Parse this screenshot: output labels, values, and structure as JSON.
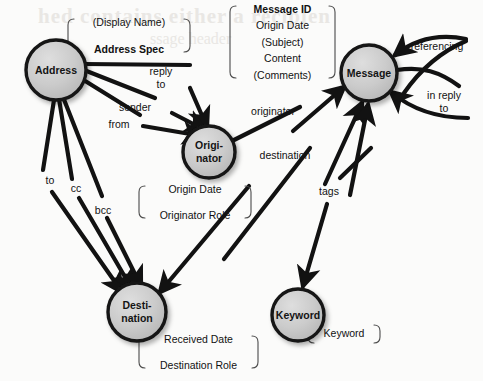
{
  "diagram": {
    "type": "entity-relationship",
    "background_color": "#fbfbfa",
    "node_fill_color": "#c9c9c9",
    "node_stroke_color": "#141414",
    "edge_color": "#121212",
    "nodes": [
      {
        "id": "address",
        "label_line1": "Address",
        "label_line2": "",
        "cx": 56,
        "cy": 70,
        "r": 30
      },
      {
        "id": "originator",
        "label_line1": "Origi-",
        "label_line2": "nator",
        "cx": 209,
        "cy": 152,
        "r": 26
      },
      {
        "id": "message",
        "label_line1": "Message",
        "label_line2": "",
        "cx": 369,
        "cy": 73,
        "r": 28
      },
      {
        "id": "destination",
        "label_line1": "Desti-",
        "label_line2": "nation",
        "cx": 137,
        "cy": 312,
        "r": 29
      },
      {
        "id": "keyword",
        "label_line1": "Keyword",
        "label_line2": "",
        "cx": 298,
        "cy": 315,
        "r": 26
      }
    ],
    "edge_labels": [
      {
        "id": "reply-to",
        "lines": [
          "reply",
          "to"
        ],
        "x": 161,
        "y": 79
      },
      {
        "id": "sender",
        "lines": [
          "sender"
        ],
        "x": 135,
        "y": 108
      },
      {
        "id": "from",
        "lines": [
          "from"
        ],
        "x": 119,
        "y": 125
      },
      {
        "id": "to",
        "lines": [
          "to"
        ],
        "x": 50,
        "y": 181
      },
      {
        "id": "cc",
        "lines": [
          "cc"
        ],
        "x": 76,
        "y": 189
      },
      {
        "id": "bcc",
        "lines": [
          "bcc"
        ],
        "x": 103,
        "y": 211
      },
      {
        "id": "originator",
        "lines": [
          "originator"
        ],
        "x": 273,
        "y": 112
      },
      {
        "id": "destination",
        "lines": [
          "destination"
        ],
        "x": 285,
        "y": 156
      },
      {
        "id": "tags",
        "lines": [
          "tags"
        ],
        "x": 329,
        "y": 192
      },
      {
        "id": "referencing",
        "lines": [
          "referencing"
        ],
        "x": 437,
        "y": 47
      },
      {
        "id": "in-reply-to",
        "lines": [
          "in reply",
          "to"
        ],
        "x": 444,
        "y": 103
      }
    ],
    "attribute_boxes": [
      {
        "id": "address-attrs",
        "x": 68,
        "y": 19,
        "w": 122,
        "h": 33,
        "lines": [
          {
            "text": "(Display Name)",
            "bold": false
          },
          {
            "text": "Address Spec",
            "bold": true
          }
        ]
      },
      {
        "id": "message-attrs",
        "x": 230,
        "y": 6,
        "w": 105,
        "h": 72,
        "lines": [
          {
            "text": "Message ID",
            "bold": true
          },
          {
            "text": "Origin Date",
            "bold": false
          },
          {
            "text": "(Subject)",
            "bold": false
          },
          {
            "text": "Content",
            "bold": false
          },
          {
            "text": "(Comments)",
            "bold": false
          }
        ]
      },
      {
        "id": "originator-attrs",
        "x": 139,
        "y": 186,
        "w": 112,
        "h": 32,
        "lines": [
          {
            "text": "Origin Date",
            "bold": false
          },
          {
            "text": "Originator Role",
            "bold": false
          }
        ]
      },
      {
        "id": "destination-attrs",
        "x": 139,
        "y": 336,
        "w": 119,
        "h": 32,
        "lines": [
          {
            "text": "Received Date",
            "bold": false
          },
          {
            "text": "Destination Role",
            "bold": false
          }
        ]
      },
      {
        "id": "keyword-attrs",
        "x": 308,
        "y": 325,
        "w": 72,
        "h": 18,
        "lines": [
          {
            "text": "Keyword",
            "bold": false
          }
        ]
      }
    ],
    "relationships": [
      {
        "from": "address",
        "to": "originator",
        "label": "reply to"
      },
      {
        "from": "address",
        "to": "originator",
        "label": "sender"
      },
      {
        "from": "address",
        "to": "originator",
        "label": "from"
      },
      {
        "from": "address",
        "to": "destination",
        "label": "to"
      },
      {
        "from": "address",
        "to": "destination",
        "label": "cc"
      },
      {
        "from": "address",
        "to": "destination",
        "label": "bcc"
      },
      {
        "from": "originator",
        "to": "message",
        "label": "originator"
      },
      {
        "from": "destination",
        "to": "message",
        "label": "destination"
      },
      {
        "from": "keyword",
        "to": "message",
        "label": "tags"
      },
      {
        "from": "message",
        "to": "message",
        "label": "referencing"
      },
      {
        "from": "message",
        "to": "message",
        "label": "in reply to"
      }
    ]
  }
}
